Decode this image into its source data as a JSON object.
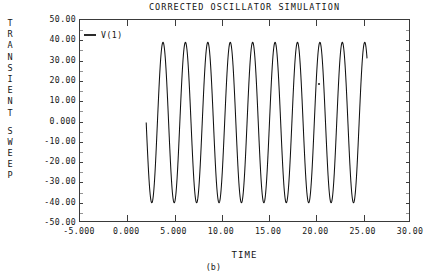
{
  "figure": {
    "caption": "(b)",
    "vertical_axis_title": "TRANSIENT SWEEP",
    "vertical_axis_lines": [
      "TRANSIENT",
      "SWEEP"
    ]
  },
  "legend": {
    "entries": [
      {
        "label": "V(1)",
        "color": "#111111"
      }
    ]
  },
  "chart_data": {
    "type": "line",
    "title": "CORRECTED OSCILLATOR SIMULATION",
    "xlabel": "TIME",
    "ylabel": "TRANSIENT SWEEP",
    "xlim": [
      -5,
      30
    ],
    "ylim": [
      -50,
      50
    ],
    "grid": false,
    "legend_position": "top-left-inside",
    "xticks": [
      -5,
      0,
      5,
      10,
      15,
      20,
      25,
      30
    ],
    "xtick_labels": [
      "-5.000",
      "0.000",
      "5.000",
      "10.00",
      "15.00",
      "20.00",
      "25.00",
      "30.00"
    ],
    "yticks": [
      50,
      40,
      30,
      20,
      10,
      0,
      -10,
      -20,
      -30,
      -40,
      -50
    ],
    "ytick_labels": [
      "50.00",
      "40.00",
      "30.00",
      "20.00",
      "10.00",
      "0.000",
      "-10.00",
      "-20.00",
      "-30.00",
      "-40.00",
      "-50.00"
    ],
    "series": [
      {
        "name": "V(1)",
        "color": "#111111",
        "waveform": "sine",
        "t_start": 2.0,
        "t_end": 25.35,
        "amplitude": 39.5,
        "offset": -0.5,
        "period": 2.37,
        "phase_deg": 180,
        "start_value": 0.0,
        "end_value": 8.0,
        "cycles": 9.85,
        "peak_max": 39.0,
        "peak_min": -40.0
      }
    ],
    "annotations": [
      {
        "name": "stray-speck",
        "x": 20.2,
        "y": 19.0
      }
    ]
  }
}
